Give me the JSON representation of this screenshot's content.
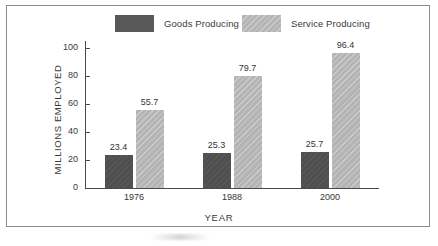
{
  "chart_data": {
    "type": "bar",
    "title": "",
    "xlabel": "YEAR",
    "ylabel": "MILLIONS EMPLOYED",
    "categories": [
      "1976",
      "1988",
      "2000"
    ],
    "ylim": [
      0,
      100
    ],
    "yticks": [
      0,
      20,
      40,
      60,
      80,
      100
    ],
    "ytick_labels": [
      "0",
      "20",
      "40",
      "60",
      "80",
      "100"
    ],
    "grid": false,
    "legend_position": "top",
    "series": [
      {
        "name": "Goods Producing",
        "color": "#4f4f4f",
        "values": [
          23.4,
          25.3,
          25.7
        ],
        "value_labels": [
          "23.4",
          "25.3",
          "25.7"
        ]
      },
      {
        "name": "Service Producing",
        "color": "#b4b4b4",
        "values": [
          55.7,
          79.7,
          96.4
        ],
        "value_labels": [
          "55.7",
          "79.7",
          "96.4"
        ]
      }
    ]
  },
  "legend": {
    "goods_label": "Goods Producing",
    "service_label": "Service Producing"
  },
  "axes": {
    "y_title": "MILLIONS EMPLOYED",
    "x_title": "YEAR",
    "y_ticks": [
      "100",
      "80",
      "60",
      "40",
      "20",
      "0"
    ],
    "x_ticks": [
      "1976",
      "1988",
      "2000"
    ]
  },
  "values": {
    "g1976": "23.4",
    "s1976": "55.7",
    "g1988": "25.3",
    "s1988": "79.7",
    "g2000": "25.7",
    "s2000": "96.4"
  },
  "colors": {
    "goods": "#4f4f4f",
    "service": "#b4b4b4",
    "axis": "#4a4a4a",
    "frame": "#8c8c92",
    "text": "#343434"
  }
}
